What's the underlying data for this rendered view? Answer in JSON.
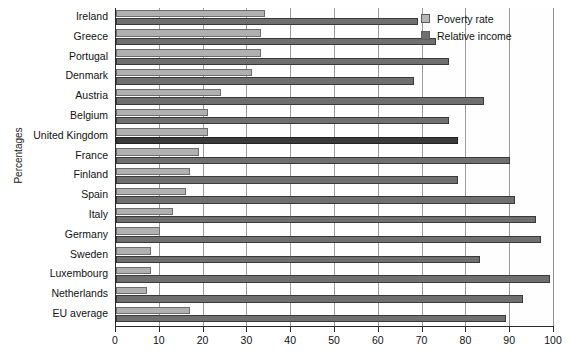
{
  "chart_data": {
    "type": "bar",
    "orientation": "horizontal",
    "title": "",
    "xlabel": "",
    "ylabel": "Percentages",
    "xlim": [
      0,
      100
    ],
    "xticks": [
      0,
      10,
      20,
      30,
      40,
      50,
      60,
      70,
      80,
      90,
      100
    ],
    "grid": true,
    "legend_position": "top-right",
    "categories": [
      "Ireland",
      "Greece",
      "Portugal",
      "Denmark",
      "Austria",
      "Belgium",
      "United Kingdom",
      "France",
      "Finland",
      "Spain",
      "Italy",
      "Germany",
      "Sweden",
      "Luxembourg",
      "Netherlands",
      "EU average"
    ],
    "series": [
      {
        "name": "Poverty rate",
        "color": "#b0b0b0",
        "values": [
          34,
          33,
          33,
          31,
          24,
          21,
          21,
          19,
          17,
          16,
          13,
          10,
          8,
          8,
          7,
          17
        ]
      },
      {
        "name": "Relative income",
        "color": "#6f6f6f",
        "values": [
          69,
          73,
          76,
          68,
          84,
          76,
          78,
          90,
          78,
          91,
          96,
          97,
          83,
          99,
          93,
          89
        ]
      }
    ],
    "highlighted_category": "United Kingdom"
  },
  "legend": {
    "items": [
      {
        "label": "Poverty rate",
        "swatch": "light-gray-swatch"
      },
      {
        "label": "Relative income",
        "swatch": "dark-gray-swatch"
      }
    ]
  },
  "axis": {
    "y_title": "Percentages",
    "x_tick_labels": [
      "0",
      "10",
      "20",
      "30",
      "40",
      "50",
      "60",
      "70",
      "80",
      "90",
      "100"
    ]
  },
  "colors": {
    "poverty_rate": "#b0b0b0",
    "relative_income": "#6f6f6f",
    "highlight": "#3a3a3a",
    "axis": "#2a2a2a",
    "grid": "#9a9a9a",
    "background": "#ffffff"
  }
}
